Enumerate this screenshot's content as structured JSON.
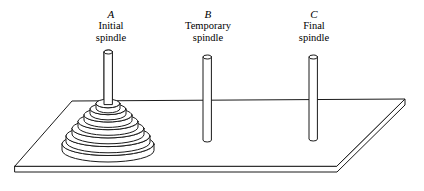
{
  "figure": {
    "stroke_color": "#1a1a1a",
    "fill_color": "#ffffff",
    "background_color": "#ffffff"
  },
  "pegs": [
    {
      "id": "a",
      "letter": "A",
      "caption_line1": "Initial",
      "caption_line2": "spindle",
      "disk_count": 7,
      "has_disks": true
    },
    {
      "id": "b",
      "letter": "B",
      "caption_line1": "Temporary",
      "caption_line2": "spindle",
      "disk_count": 0,
      "has_disks": false
    },
    {
      "id": "c",
      "letter": "C",
      "caption_line1": "Final",
      "caption_line2": "spindle",
      "disk_count": 0,
      "has_disks": false
    }
  ],
  "board": {
    "name": "base-board",
    "shape": "parallelogram-slab"
  }
}
